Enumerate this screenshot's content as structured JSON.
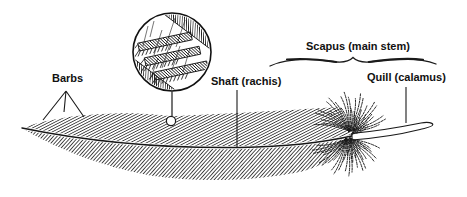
{
  "window": {
    "width": 467,
    "height": 197,
    "background": "#ffffff"
  },
  "diagram": {
    "ink_color": "#1a1a1a",
    "labels": {
      "barbs": "Barbs",
      "shaft": "Shaft (rachis)",
      "scapus": "Scapus (main stem)",
      "quill": "Quill (calamus)"
    },
    "inset": "magnified-barbs-detail"
  }
}
